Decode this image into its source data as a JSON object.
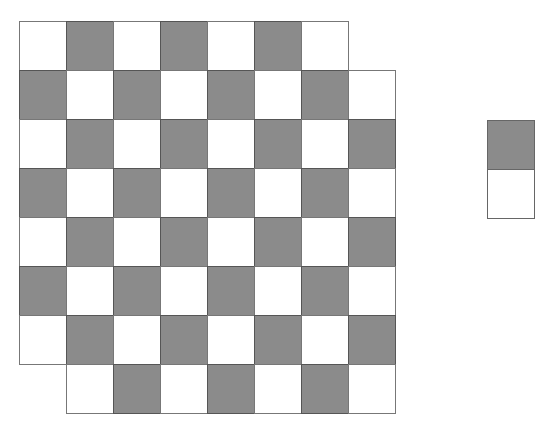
{
  "diagram": {
    "colors": {
      "dark": "#8b8b8b",
      "light": "#ffffff",
      "line": "#555555"
    },
    "board": {
      "origin": [
        19,
        21
      ],
      "cell_size": 47,
      "rows": 8,
      "cols": 8,
      "removed_cells": [
        [
          0,
          7
        ],
        [
          7,
          0
        ]
      ],
      "pattern": [
        [
          "W",
          "G",
          "W",
          "G",
          "W",
          "G",
          "W",
          null
        ],
        [
          "G",
          "W",
          "G",
          "W",
          "G",
          "W",
          "G",
          "W"
        ],
        [
          "W",
          "G",
          "W",
          "G",
          "W",
          "G",
          "W",
          "G"
        ],
        [
          "G",
          "W",
          "G",
          "W",
          "G",
          "W",
          "G",
          "W"
        ],
        [
          "W",
          "G",
          "W",
          "G",
          "W",
          "G",
          "W",
          "G"
        ],
        [
          "G",
          "W",
          "G",
          "W",
          "G",
          "W",
          "G",
          "W"
        ],
        [
          "W",
          "G",
          "W",
          "G",
          "W",
          "G",
          "W",
          "G"
        ],
        [
          null,
          "W",
          "G",
          "W",
          "G",
          "W",
          "G",
          "W"
        ]
      ]
    },
    "domino": {
      "x": 487,
      "y": 120,
      "width": 48,
      "cell_height": 49,
      "cells": [
        "G",
        "W"
      ]
    }
  }
}
